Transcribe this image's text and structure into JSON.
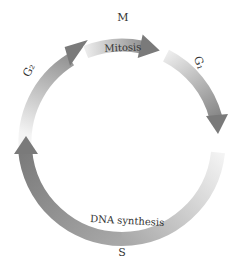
{
  "diagram": {
    "phases": [
      {
        "id": "M",
        "label": "M",
        "description": "Mitosis"
      },
      {
        "id": "G1",
        "label": "G₁",
        "description": ""
      },
      {
        "id": "S",
        "label": "S",
        "description": "DNA synthesis"
      },
      {
        "id": "G2",
        "label": "G₂",
        "description": ""
      }
    ],
    "colors": {
      "arrow_dark": "#7a7a7a",
      "arrow_light": "#f2f2f2",
      "text": "#333333",
      "background": "#ffffff"
    }
  }
}
